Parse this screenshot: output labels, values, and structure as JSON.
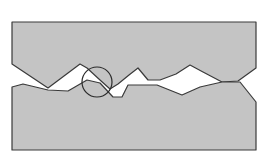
{
  "diagram": {
    "type": "surface-contact-cross-section",
    "colors": {
      "background": "#ffffff",
      "fill": "#c4c4c4",
      "stroke": "#3a3a3a",
      "gap": "#ffffff"
    },
    "upper_body": {
      "points": "12,22 256,22 256,68 238,81 222,82 203,72 190,65 176,74 160,80 148,80 138,68 129,75 118,84 110,89 100,80 87,68 80,64 48,88 12,64"
    },
    "lower_body": {
      "points": "12,87 23,84 48,90 68,91 87,80 100,83 113,97 122,97 128,85 157,85 182,95 200,87 222,82 240,82 256,102 256,150 12,150"
    },
    "highlight_circle": {
      "cx": 97,
      "cy": 82,
      "r": 15
    }
  }
}
